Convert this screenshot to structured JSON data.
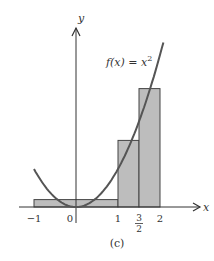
{
  "chart_data": {
    "type": "area",
    "title": "",
    "caption": "(c)",
    "function_label": "f(x) = x",
    "function_label_exponent": "2",
    "function": "x^2",
    "xlabel": "x",
    "ylabel": "y",
    "xlim": [
      -1,
      2
    ],
    "x_ticks": [
      {
        "value": -1,
        "label": "−1"
      },
      {
        "value": 0,
        "label": "0"
      },
      {
        "value": 1,
        "label": "1"
      },
      {
        "value": 1.5,
        "label_num": "3",
        "label_den": "2"
      },
      {
        "value": 2,
        "label": "2"
      }
    ],
    "rectangles": [
      {
        "x0": -1,
        "x1": 1,
        "height": 0.25
      },
      {
        "x0": 1,
        "x1": 1.5,
        "height": 2.25
      },
      {
        "x0": 1.5,
        "x1": 2,
        "height": 4
      }
    ],
    "colors": {
      "rect_fill": "#bdbdbd",
      "rect_stroke": "#444444",
      "curve": "#555555",
      "axis": "#333333"
    },
    "grid": false
  }
}
